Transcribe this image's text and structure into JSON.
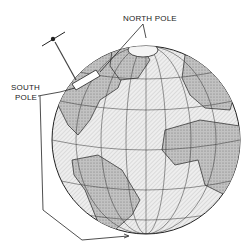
{
  "diagram": {
    "labels": {
      "north_pole": "NORTH POLE",
      "south_pole_line1": "SOUTH",
      "south_pole_line2": "POLE"
    },
    "elements": [
      "globe",
      "satellite",
      "north-pole-cap",
      "pointer-lines"
    ],
    "colors": {
      "ink": "#222222",
      "ocean": "#e4e4e4",
      "land": "#b8b8b8"
    }
  }
}
